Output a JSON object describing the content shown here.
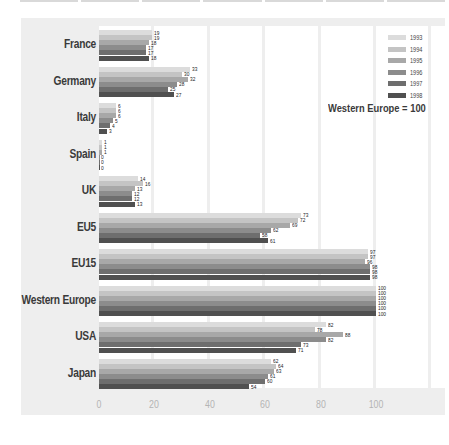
{
  "chart_data": {
    "type": "bar",
    "orientation": "horizontal",
    "title": "",
    "annotation": "Western Europe = 100",
    "xlabel": "",
    "ylabel": "",
    "xlim": [
      0,
      120
    ],
    "x_ticks": [
      "0",
      "20",
      "40",
      "60",
      "80",
      "100"
    ],
    "grid": true,
    "legend_position": "top-right",
    "categories": [
      "France",
      "Germany",
      "Italy",
      "Spain",
      "UK",
      "EU5",
      "EU15",
      "Western Europe",
      "USA",
      "Japan"
    ],
    "series": [
      {
        "name": "1993",
        "color": "#dcdcdc",
        "values": [
          19,
          33,
          6,
          1,
          14,
          73,
          97,
          100,
          82,
          62
        ]
      },
      {
        "name": "1994",
        "color": "#c4c4c4",
        "values": [
          19,
          30,
          6,
          1,
          16,
          72,
          97,
          100,
          78,
          64
        ]
      },
      {
        "name": "1995",
        "color": "#a8a8a8",
        "values": [
          18,
          32,
          6,
          1,
          13,
          69,
          96,
          100,
          88,
          63
        ]
      },
      {
        "name": "1996",
        "color": "#8c8c8c",
        "values": [
          17,
          28,
          5,
          0,
          12,
          62,
          98,
          100,
          82,
          61
        ]
      },
      {
        "name": "1997",
        "color": "#6e6e6e",
        "values": [
          17,
          25,
          4,
          0,
          12,
          58,
          98,
          100,
          73,
          60
        ]
      },
      {
        "name": "1998",
        "color": "#505050",
        "values": [
          18,
          27,
          3,
          0,
          13,
          61,
          98,
          100,
          71,
          54
        ]
      }
    ]
  }
}
